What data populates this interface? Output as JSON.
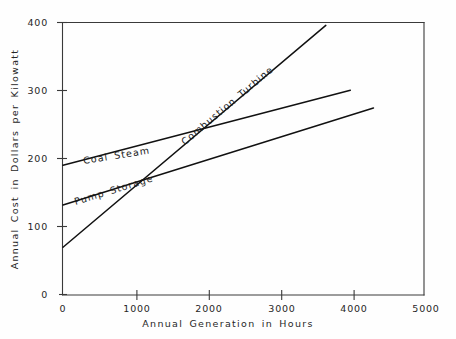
{
  "chart_data": {
    "type": "line",
    "title": "",
    "xlabel": "Annual Generation in Hours",
    "ylabel": "Annual Cost in Dollars per Kilowatt",
    "xlim": [
      0,
      5000
    ],
    "ylim": [
      0,
      400
    ],
    "xticks": [
      0,
      1000,
      2000,
      3000,
      4000,
      5000
    ],
    "xtick_labels": [
      "0",
      "1000",
      "2000",
      "3000",
      "4000",
      "5000"
    ],
    "yticks": [
      0,
      100,
      200,
      300,
      400
    ],
    "ytick_labels": [
      "0",
      "100",
      "200",
      "300",
      "400"
    ],
    "grid": false,
    "legend": "inline-labels",
    "line_color": "#111111",
    "axis_color": "#3a3a3a",
    "background_color": "#fefefe",
    "series": [
      {
        "name": "Coal Steam",
        "label": "Coal Steam",
        "x": [
          0,
          3980
        ],
        "values": [
          190,
          300
        ]
      },
      {
        "name": "Pump Storage",
        "label": "Pump Storage",
        "x": [
          0,
          4300
        ],
        "values": [
          132,
          274
        ]
      },
      {
        "name": "Combustion Turbine",
        "label": "Combustion Turbine",
        "x": [
          0,
          3640
        ],
        "values": [
          70,
          395
        ]
      }
    ],
    "annotations": [
      {
        "name": "pump-storage-combustion-turbine-crossing",
        "x": 1250,
        "y": 175
      },
      {
        "name": "coal-steam-pump-storage-crossing",
        "x": 2750,
        "y": 247
      }
    ]
  }
}
